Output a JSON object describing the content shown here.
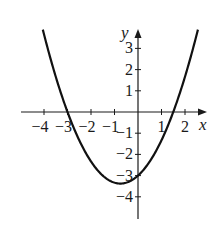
{
  "chart_data": {
    "type": "line",
    "title": "",
    "xlabel": "x",
    "ylabel": "y",
    "function": "y = (2/3)x^2 + x - 3",
    "xlim": [
      -4.05,
      2.65
    ],
    "ylim": [
      -4.6,
      4.0
    ],
    "grid": false,
    "legend": null,
    "x_ticks": [
      -4,
      -3,
      -2,
      -1,
      1,
      2
    ],
    "x_tick_labels": [
      "−4",
      "−3",
      "−2",
      "−1",
      "1",
      "2"
    ],
    "y_ticks": [
      3,
      2,
      1,
      -1,
      -2,
      -3,
      -4
    ],
    "y_tick_labels": [
      "3",
      "2",
      "1",
      "−1",
      "−2",
      "−3",
      "−4"
    ],
    "annotations": {
      "x_intercepts": [
        -3,
        1.5
      ],
      "y_intercept": -3,
      "vertex": [
        -0.75,
        -3.375
      ]
    },
    "series": [
      {
        "name": "parabola",
        "x": [
          -4.0,
          -3.5,
          -3.0,
          -2.5,
          -2.0,
          -1.5,
          -1.0,
          -0.75,
          -0.5,
          0.0,
          0.5,
          1.0,
          1.5,
          2.0,
          2.5
        ],
        "y": [
          3.67,
          1.67,
          0.0,
          -1.33,
          -2.33,
          -3.0,
          -3.33,
          -3.375,
          -3.33,
          -3.0,
          -2.33,
          -1.33,
          0.0,
          1.67,
          3.67
        ]
      }
    ],
    "colors": {
      "axis": "#1a1a1a",
      "curve": "#111111",
      "background": "#ffffff"
    }
  }
}
